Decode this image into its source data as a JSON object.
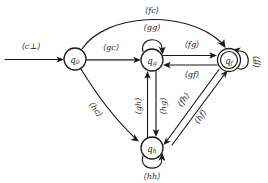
{
  "diagram": {
    "background_color": "#ffffff",
    "stroke_color": "#1a1a1a",
    "width": 268,
    "height": 183,
    "states": [
      {
        "id": "q0",
        "name": "q",
        "subscript": "0",
        "accepting": false,
        "cx": 75,
        "cy": 59,
        "r": 11
      },
      {
        "id": "qg",
        "name": "q",
        "subscript": "g",
        "accepting": false,
        "cx": 152,
        "cy": 60,
        "r": 11
      },
      {
        "id": "qf",
        "name": "q",
        "subscript": "f",
        "accepting": true,
        "cx": 229,
        "cy": 60,
        "r": 11.5,
        "r_inner": 8.5
      },
      {
        "id": "qh",
        "name": "q",
        "subscript": "h",
        "accepting": false,
        "cx": 152,
        "cy": 148,
        "r": 11
      }
    ],
    "transitions": [
      {
        "id": "start",
        "from": "",
        "to": "q0",
        "label": "⟨c⊥⟩",
        "kind": "initial"
      },
      {
        "id": "t_fc",
        "from": "q0",
        "to": "qf",
        "label": "⟨fc⟩",
        "kind": "arc-over-top"
      },
      {
        "id": "t_gc",
        "from": "q0",
        "to": "qg",
        "label": "⟨gc⟩",
        "kind": "straight"
      },
      {
        "id": "t_hc",
        "from": "q0",
        "to": "qh",
        "label": "⟨hc⟩",
        "kind": "diagonal"
      },
      {
        "id": "t_gg",
        "from": "qg",
        "to": "qg",
        "label": "⟨gg⟩",
        "kind": "self-loop-top"
      },
      {
        "id": "t_fg",
        "from": "qg",
        "to": "qf",
        "label": "⟨fg⟩",
        "kind": "pair-upper"
      },
      {
        "id": "t_gf",
        "from": "qf",
        "to": "qg",
        "label": "⟨gf⟩",
        "kind": "pair-lower"
      },
      {
        "id": "t_gh",
        "from": "qh",
        "to": "qg",
        "label": "⟨gh⟩",
        "kind": "pair-left"
      },
      {
        "id": "t_hg",
        "from": "qg",
        "to": "qh",
        "label": "⟨hg⟩",
        "kind": "pair-right"
      },
      {
        "id": "t_fh",
        "from": "qf",
        "to": "qh",
        "label": "⟨fh⟩",
        "kind": "diagonal-upper"
      },
      {
        "id": "t_hf",
        "from": "qh",
        "to": "qf",
        "label": "⟨hf⟩",
        "kind": "diagonal-lower"
      },
      {
        "id": "t_hh",
        "from": "qh",
        "to": "qh",
        "label": "⟨hh⟩",
        "kind": "self-loop-bottom"
      },
      {
        "id": "t_ff",
        "from": "qf",
        "to": "qf",
        "label": "⟨ff⟩",
        "kind": "self-loop-right"
      }
    ]
  }
}
